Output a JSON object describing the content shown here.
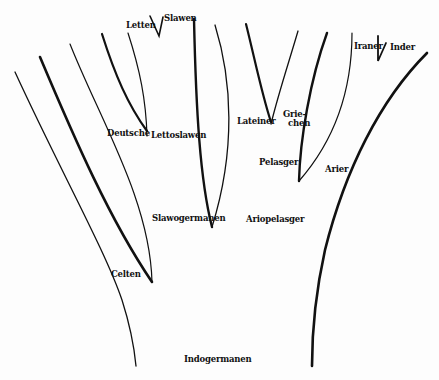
{
  "diagram": {
    "type": "tree",
    "title": "",
    "ink_color": "#111111",
    "background": "#fdfdfd",
    "labels": {
      "letten": "Letten",
      "slawen": "Slawen",
      "deutsche": "Deutsche",
      "lettoslawen": "Lettoslawen",
      "slawogermanen": "Slawogermanen",
      "celten": "Celten",
      "lateiner": "Lateiner",
      "griechen_1": "Grie-",
      "griechen_2": "chen",
      "pelasger": "Pelasger",
      "arier": "Arier",
      "ariopelasger": "Ariopelasger",
      "iraner": "Iraner",
      "inder": "Inder",
      "indogermanen": "Indogermanen"
    },
    "nodes": [
      {
        "id": "indogermanen",
        "label": "Indogermanen",
        "parent": null
      },
      {
        "id": "slawogermanen",
        "label": "Slawogermanen",
        "parent": "indogermanen"
      },
      {
        "id": "ariopelasger",
        "label": "Ariopelasger",
        "parent": "indogermanen"
      },
      {
        "id": "celten",
        "label": "Celten",
        "parent": "indogermanen"
      },
      {
        "id": "lettoslawen",
        "label": "Lettoslawen",
        "parent": "slawogermanen"
      },
      {
        "id": "deutsche",
        "label": "Deutsche",
        "parent": "slawogermanen"
      },
      {
        "id": "letten",
        "label": "Letten",
        "parent": "lettoslawen"
      },
      {
        "id": "slawen",
        "label": "Slawen",
        "parent": "lettoslawen"
      },
      {
        "id": "pelasger",
        "label": "Pelasger",
        "parent": "ariopelasger"
      },
      {
        "id": "arier",
        "label": "Arier",
        "parent": "ariopelasger"
      },
      {
        "id": "lateiner",
        "label": "Lateiner",
        "parent": "pelasger"
      },
      {
        "id": "griechen",
        "label": "Griechen",
        "parent": "pelasger"
      },
      {
        "id": "iraner",
        "label": "Iraner",
        "parent": "arier"
      },
      {
        "id": "inder",
        "label": "Inder",
        "parent": "arier"
      }
    ]
  }
}
